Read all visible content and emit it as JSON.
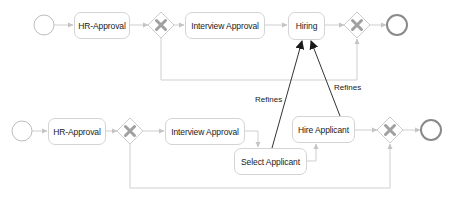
{
  "colors": {
    "flow_line": "#cfcfcf",
    "flow_arrow": "#c4c4c4",
    "task_border": "#d4d4d4",
    "gateway_border": "#cccccc",
    "gateway_x": "#a0a0a0",
    "start_event": "#bdbdbd",
    "end_event": "#8a8a8a",
    "refines_line": "#333333",
    "text": "#1a1a1a"
  },
  "top_process": {
    "start_event": "start-event",
    "tasks": [
      {
        "id": "hr_approval",
        "label": "HR-Approval"
      },
      {
        "id": "interview_approval",
        "label": "Interview Approval"
      },
      {
        "id": "hiring",
        "label": "Hiring"
      }
    ],
    "gateways": [
      "exclusive-gateway",
      "exclusive-gateway"
    ],
    "end_event": "end-event"
  },
  "bottom_process": {
    "start_event": "start-event",
    "tasks": [
      {
        "id": "hr_approval",
        "label": "HR-Approval"
      },
      {
        "id": "interview_approval",
        "label": "Interview Approval"
      },
      {
        "id": "select_applicant",
        "label": "Select Applicant"
      },
      {
        "id": "hire_applicant",
        "label": "Hire Applicant"
      }
    ],
    "gateways": [
      "exclusive-gateway",
      "exclusive-gateway"
    ],
    "end_event": "end-event"
  },
  "relations": [
    {
      "from": "Select Applicant",
      "to": "Hiring",
      "label": "Refines"
    },
    {
      "from": "Hire Applicant",
      "to": "Hiring",
      "label": "Refines"
    }
  ]
}
